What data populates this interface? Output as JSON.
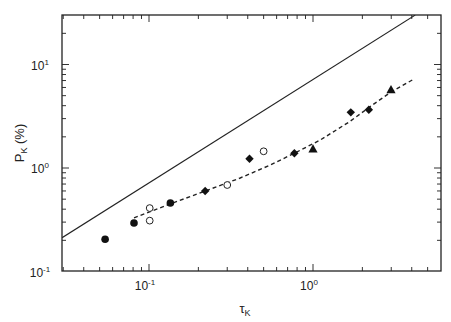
{
  "chart_data": {
    "type": "scatter",
    "title": "",
    "xlabel": "τK",
    "xlabel_main": "τ",
    "xlabel_sub": "K",
    "ylabel": "PK (%)",
    "ylabel_main": "P",
    "ylabel_sub": "K",
    "ylabel_suffix": " (%)",
    "xscale": "log",
    "yscale": "log",
    "xlim": [
      0.0295,
      6.0
    ],
    "ylim": [
      0.1,
      30
    ],
    "grid": false,
    "legend": null,
    "x_major_ticks": [
      {
        "value": 0.1,
        "base": "10",
        "exp": "-1"
      },
      {
        "value": 1,
        "base": "10",
        "exp": "0"
      }
    ],
    "y_major_ticks": [
      {
        "value": 0.1,
        "base": "10",
        "exp": "-1"
      },
      {
        "value": 1,
        "base": "10",
        "exp": "0"
      },
      {
        "value": 10,
        "base": "10",
        "exp": "1"
      }
    ],
    "series": [
      {
        "name": "filled circles",
        "marker": "filled-circle",
        "points": [
          {
            "x": 0.054,
            "y": 0.205
          },
          {
            "x": 0.081,
            "y": 0.294
          },
          {
            "x": 0.135,
            "y": 0.459
          }
        ]
      },
      {
        "name": "open circles",
        "marker": "open-circle",
        "points": [
          {
            "x": 0.101,
            "y": 0.41
          },
          {
            "x": 0.101,
            "y": 0.31
          },
          {
            "x": 0.3,
            "y": 0.685
          },
          {
            "x": 0.5,
            "y": 1.45
          }
        ]
      },
      {
        "name": "filled diamonds",
        "marker": "filled-diamond",
        "points": [
          {
            "x": 0.22,
            "y": 0.6
          },
          {
            "x": 0.41,
            "y": 1.23
          },
          {
            "x": 0.77,
            "y": 1.39
          },
          {
            "x": 1.7,
            "y": 3.45
          },
          {
            "x": 2.19,
            "y": 3.66
          }
        ]
      },
      {
        "name": "filled triangles",
        "marker": "filled-triangle",
        "points": [
          {
            "x": 1.0,
            "y": 1.53
          },
          {
            "x": 2.99,
            "y": 5.71
          }
        ]
      }
    ],
    "lines": [
      {
        "name": "solid reference line (slope 1)",
        "style": "solid",
        "points": [
          {
            "x": 0.0295,
            "y": 0.212
          },
          {
            "x": 4.2,
            "y": 30
          }
        ]
      },
      {
        "name": "dashed fit curve",
        "style": "dashed",
        "points": [
          {
            "x": 0.081,
            "y": 0.33
          },
          {
            "x": 0.135,
            "y": 0.45
          },
          {
            "x": 0.22,
            "y": 0.6
          },
          {
            "x": 0.36,
            "y": 0.8
          },
          {
            "x": 0.55,
            "y": 1.07
          },
          {
            "x": 0.77,
            "y": 1.39
          },
          {
            "x": 1.1,
            "y": 1.85
          },
          {
            "x": 1.68,
            "y": 2.82
          },
          {
            "x": 2.22,
            "y": 3.89
          },
          {
            "x": 2.95,
            "y": 5.35
          },
          {
            "x": 4.1,
            "y": 7.2
          }
        ]
      }
    ]
  }
}
